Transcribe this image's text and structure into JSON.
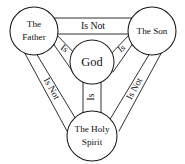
{
  "diagram": {
    "background_color": "#ffffff",
    "line_color": "#1a1a1a",
    "text_color": "#111111",
    "nodes": [
      {
        "id": "father",
        "label_line1": "The",
        "label_line2": "Father",
        "label": "The Father",
        "cx": 34,
        "cy": 31,
        "r": 24
      },
      {
        "id": "son",
        "label_line1": "The Son",
        "label_line2": "",
        "label": "The Son",
        "cx": 152,
        "cy": 31,
        "r": 24
      },
      {
        "id": "holy-spirit",
        "label_line1": "The Holy",
        "label_line2": "Spirit",
        "label": "The Holy Spirit",
        "cx": 92,
        "cy": 136,
        "r": 25
      },
      {
        "id": "god",
        "label_line1": "God",
        "label_line2": "",
        "label": "God",
        "cx": 92,
        "cy": 62,
        "r": 22
      }
    ],
    "bands": [
      {
        "id": "father-son",
        "label": "Is Not",
        "from": "father",
        "to": "son",
        "rotation": 0
      },
      {
        "id": "father-holyspirit",
        "label": "Is Not",
        "from": "father",
        "to": "holy-spirit",
        "rotation": 62
      },
      {
        "id": "son-holyspirit",
        "label": "Is Not",
        "from": "son",
        "to": "holy-spirit",
        "rotation": -62
      },
      {
        "id": "father-god",
        "label": "Is",
        "from": "father",
        "to": "god",
        "rotation": 27
      },
      {
        "id": "son-god",
        "label": "Is",
        "from": "son",
        "to": "god",
        "rotation": -27
      },
      {
        "id": "god-holyspirit",
        "label": "Is",
        "from": "god",
        "to": "holy-spirit",
        "rotation": -90
      }
    ]
  }
}
